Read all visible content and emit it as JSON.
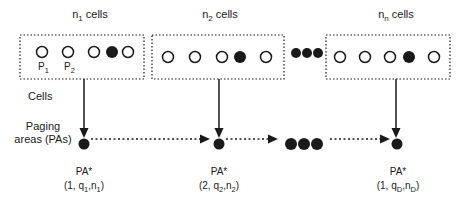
{
  "diagram": {
    "title_labels": [
      {
        "base": "n",
        "sub": "1",
        "suffix": " cells"
      },
      {
        "base": "n",
        "sub": "2",
        "suffix": " cells"
      },
      {
        "base": "n",
        "sub": "n",
        "suffix": " cells"
      }
    ],
    "cell_labels": [
      {
        "base": "P",
        "sub": "1"
      },
      {
        "base": "P",
        "sub": "2"
      }
    ],
    "side_labels": {
      "cells": "Cells",
      "paging_line1": "Paging",
      "paging_line2": "areas (PAs)"
    },
    "pa_labels": [
      {
        "name": "PA*",
        "open": "(1, q",
        "sub1": "1",
        "mid": ",n",
        "sub2": "1",
        "close": ")"
      },
      {
        "name": "PA*",
        "open": "(2, q",
        "sub1": "2",
        "mid": ",n",
        "sub2": "2",
        "close": ")"
      },
      {
        "name": "PA*",
        "open": "(1, q",
        "sub1": "D",
        "mid": ",n",
        "sub2": "D",
        "close": ")"
      }
    ],
    "colors": {
      "ink": "#1a1a1a",
      "background": "#ffffff"
    }
  }
}
